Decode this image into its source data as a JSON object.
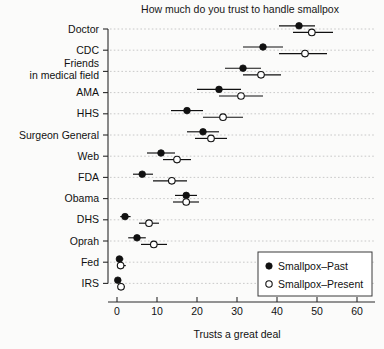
{
  "chart_data": {
    "type": "scatter",
    "title": "How much do you trust to handle smallpox",
    "xlabel": "Trusts a great deal",
    "ylabel": "",
    "xlim": [
      -1.5,
      66
    ],
    "xticks": [
      0,
      10,
      20,
      30,
      40,
      50,
      60
    ],
    "xtick_labels": [
      "0",
      "10",
      "20",
      "30",
      "40",
      "50",
      "60"
    ],
    "grid": "horizontal-dotted",
    "legend_position": "bottom-right",
    "categories": [
      "Doctor",
      "CDC",
      "Friends\nin medical field",
      "AMA",
      "HHS",
      "Surgeon General",
      "Web",
      "FDA",
      "Obama",
      "DHS",
      "Oprah",
      "Fed",
      "IRS"
    ],
    "series": [
      {
        "name": "Smallpox-Past",
        "marker": "filled-circle",
        "values": [
          45.5,
          36.5,
          31.5,
          25.5,
          17.5,
          21.5,
          11.0,
          6.3,
          17.3,
          2.0,
          5.0,
          0.6,
          0.2
        ],
        "ci_low": [
          40.5,
          31.5,
          27.0,
          20.0,
          13.5,
          17.5,
          7.5,
          4.0,
          14.5,
          0.8,
          2.8,
          0.0,
          0.0
        ],
        "ci_high": [
          49.5,
          41.5,
          36.0,
          31.0,
          21.5,
          25.5,
          14.5,
          9.0,
          20.0,
          3.4,
          7.2,
          1.6,
          0.8
        ]
      },
      {
        "name": "Smallpox-Present",
        "marker": "open-circle",
        "values": [
          48.7,
          47.0,
          36.0,
          31.0,
          26.5,
          23.5,
          15.0,
          13.7,
          17.3,
          8.0,
          9.2,
          0.9,
          1.0
        ],
        "ci_low": [
          44.0,
          40.5,
          31.5,
          25.5,
          21.5,
          19.5,
          11.5,
          9.0,
          14.0,
          5.5,
          6.0,
          0.0,
          0.2
        ],
        "ci_high": [
          54.0,
          52.5,
          41.0,
          36.5,
          31.5,
          27.5,
          18.5,
          17.5,
          20.5,
          10.5,
          12.5,
          2.2,
          2.0
        ]
      }
    ],
    "legend": [
      {
        "label": "Smallpox–Past",
        "marker": "filled-circle"
      },
      {
        "label": "Smallpox–Present",
        "marker": "open-circle"
      }
    ]
  },
  "colors": {
    "ink": "#111111",
    "grid": "#bdbdbd",
    "background": "#fbfbfa"
  }
}
